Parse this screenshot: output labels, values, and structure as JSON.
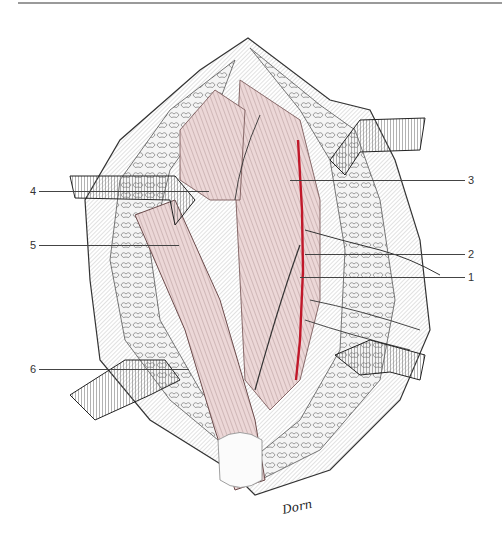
{
  "figure": {
    "signature": "Dorn",
    "colors": {
      "muscle": "#e9d3d3",
      "muscle_stroke": "#7a5a5a",
      "vessel": "#c0182a",
      "fat": "#f2f2f2",
      "ink": "#222222",
      "retractor": "#dcdcdc",
      "rule": "#9a9a9a"
    },
    "labels": {
      "left": [
        {
          "num": "4",
          "y": 191
        },
        {
          "num": "5",
          "y": 245
        },
        {
          "num": "6",
          "y": 369
        }
      ],
      "right": [
        {
          "num": "3",
          "y": 180
        },
        {
          "num": "2",
          "y": 254
        },
        {
          "num": "1",
          "y": 277
        }
      ]
    }
  }
}
